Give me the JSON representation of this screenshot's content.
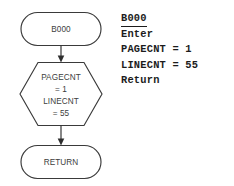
{
  "figure": {
    "kind": "flowchart-with-pseudocode",
    "background_color": "#ffffff",
    "line_color": "#3a3a3a",
    "text_color": "#3d3d3d",
    "code_color": "#1c1c1c"
  },
  "flowchart": {
    "nodes": [
      {
        "id": "start-terminator",
        "shape": "terminator",
        "lines": [
          "B000"
        ]
      },
      {
        "id": "preparation-hexagon",
        "shape": "hexagon",
        "lines": [
          "PAGECNT",
          "= 1",
          "LINECNT",
          "= 55"
        ]
      },
      {
        "id": "end-terminator",
        "shape": "terminator",
        "lines": [
          "RETURN"
        ]
      }
    ],
    "connectors": [
      {
        "id": "arrow-start-to-hexagon",
        "from": "start-terminator",
        "to": "preparation-hexagon",
        "direction": "down"
      },
      {
        "id": "arrow-hexagon-to-end",
        "from": "preparation-hexagon",
        "to": "end-terminator",
        "direction": "down"
      }
    ]
  },
  "pseudocode": {
    "lines": [
      {
        "text": "B000",
        "underlined": true
      },
      {
        "text": "Enter",
        "underlined": false
      },
      {
        "text": "PAGECNT = 1",
        "underlined": false
      },
      {
        "text": "LINECNT = 55",
        "underlined": false
      },
      {
        "text": "Return",
        "underlined": false
      }
    ]
  }
}
